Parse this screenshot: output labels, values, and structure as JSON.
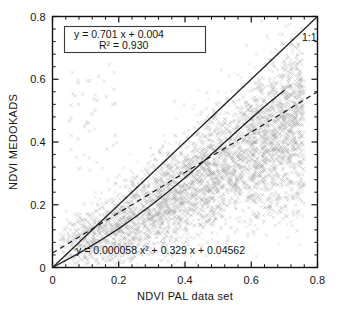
{
  "chart_data": {
    "type": "scatter",
    "title": "",
    "xlabel": "NDVI PAL data set",
    "ylabel": "NDVI MEDOKADS",
    "xlim": [
      0,
      0.8
    ],
    "ylim": [
      0,
      0.8
    ],
    "xticks": [
      "0",
      "0.2",
      "0.4",
      "0.6",
      "0.8"
    ],
    "xtick_values": [
      0,
      0.2,
      0.4,
      0.6,
      0.8
    ],
    "yticks": [
      "0",
      "0.2",
      "0.4",
      "0.6",
      "0.8"
    ],
    "ytick_values": [
      0,
      0.2,
      0.4,
      0.6,
      0.8
    ],
    "minor_ticks_per_interval": 4,
    "grid": false,
    "marker": "x",
    "marker_color": "#9a9a9a",
    "point_count_approx": 4200,
    "annotations": [
      {
        "name": "one-to-one-label",
        "text": "1:1",
        "x": 0.735,
        "y": 0.735
      }
    ],
    "legend_box": {
      "line1": "y  =    0.701  x  +  0.004",
      "line2": "R²  =  0.930",
      "slope": 0.701,
      "intercept": 0.004,
      "r_squared": 0.93,
      "x": 0.045,
      "y": 0.74
    },
    "bottom_equation": {
      "text": "y  =  0.000058 x²  +  0.329 x  +  0.04562",
      "quadratic_coefficient": 5.8e-05,
      "linear_coefficient": 0.329,
      "constant": 0.04562,
      "x": 0.085,
      "y": 0.055
    },
    "series": [
      {
        "name": "one-to-one-line",
        "type": "line",
        "style": "solid",
        "x": [
          0,
          0.8
        ],
        "y": [
          0,
          0.8
        ]
      },
      {
        "name": "regression-curve-solid",
        "type": "line",
        "style": "solid",
        "x": [
          0.0,
          0.05,
          0.1,
          0.15,
          0.2,
          0.25,
          0.3,
          0.35,
          0.4,
          0.45,
          0.5,
          0.55,
          0.6,
          0.65,
          0.7
        ],
        "y": [
          0.0,
          0.028,
          0.058,
          0.09,
          0.124,
          0.161,
          0.2,
          0.242,
          0.286,
          0.332,
          0.38,
          0.428,
          0.476,
          0.522,
          0.565
        ]
      },
      {
        "name": "linear-fit-dashed",
        "type": "line",
        "style": "dashed",
        "x": [
          0.0,
          0.8
        ],
        "y": [
          0.046,
          0.56
        ]
      }
    ],
    "point_clusters": [
      {
        "name": "main-ridge",
        "x_range": [
          0.02,
          0.76
        ],
        "y_range": [
          0.02,
          0.65
        ],
        "density": "high"
      },
      {
        "name": "upper-left-outliers",
        "x_range": [
          0.05,
          0.2
        ],
        "y_range": [
          0.3,
          0.65
        ],
        "density": "low"
      },
      {
        "name": "lower-right-spread",
        "x_range": [
          0.6,
          0.76
        ],
        "y_range": [
          0.15,
          0.4
        ],
        "density": "medium"
      }
    ]
  },
  "axes": {
    "x_title": "NDVI PAL data set",
    "y_title": "NDVI MEDOKADS"
  },
  "colors": {
    "frame": "#111111",
    "marker": "#9a9a9a",
    "curve": "#222222",
    "text": "#141414",
    "background": "#ffffff"
  }
}
